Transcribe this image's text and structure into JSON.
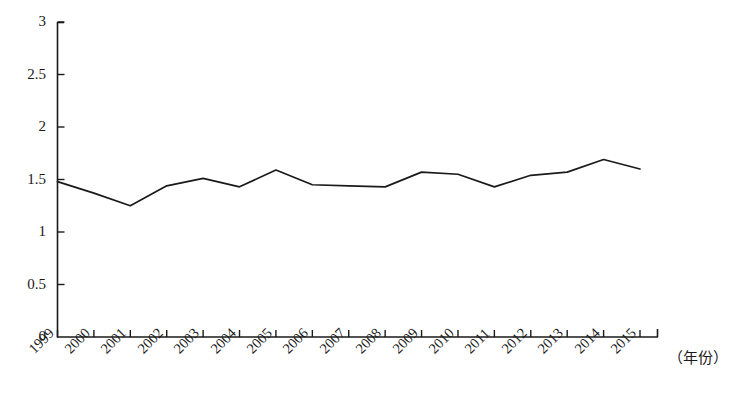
{
  "chart_data": {
    "type": "line",
    "title": "",
    "subtitle": "",
    "xlabel": "（年份）",
    "ylabel": "",
    "xlim": [
      1999,
      2015
    ],
    "ylim": [
      0,
      3
    ],
    "grid": false,
    "legend": null,
    "legend_position": "none",
    "line_color": "#1a1a1a",
    "axis_color": "#1a1a1a",
    "x": [
      1999,
      2000,
      2001,
      2002,
      2003,
      2004,
      2005,
      2006,
      2007,
      2008,
      2009,
      2010,
      2011,
      2012,
      2013,
      2014,
      2015
    ],
    "categories": [
      "1999",
      "2000",
      "2001",
      "2002",
      "2003",
      "2004",
      "2005",
      "2006",
      "2007",
      "2008",
      "2009",
      "2010",
      "2011",
      "2012",
      "2013",
      "2014",
      "2015"
    ],
    "values": [
      1.48,
      1.37,
      1.25,
      1.44,
      1.51,
      1.43,
      1.59,
      1.45,
      1.44,
      1.43,
      1.57,
      1.55,
      1.43,
      1.54,
      1.57,
      1.69,
      1.6
    ],
    "series": [
      {
        "name": "",
        "values": [
          1.48,
          1.37,
          1.25,
          1.44,
          1.51,
          1.43,
          1.59,
          1.45,
          1.44,
          1.43,
          1.57,
          1.55,
          1.43,
          1.54,
          1.57,
          1.69,
          1.6
        ]
      }
    ],
    "ytick_labels": [
      "0",
      "0.5",
      "1",
      "1.5",
      "2",
      "2.5",
      "3"
    ],
    "ytick_values": [
      0,
      0.5,
      1,
      1.5,
      2,
      2.5,
      3
    ],
    "xtick_labels": [
      "1999",
      "2000",
      "2001",
      "2002",
      "2003",
      "2004",
      "2005",
      "2006",
      "2007",
      "2008",
      "2009",
      "2010",
      "2011",
      "2012",
      "2013",
      "2014",
      "2015"
    ],
    "annotations": []
  }
}
